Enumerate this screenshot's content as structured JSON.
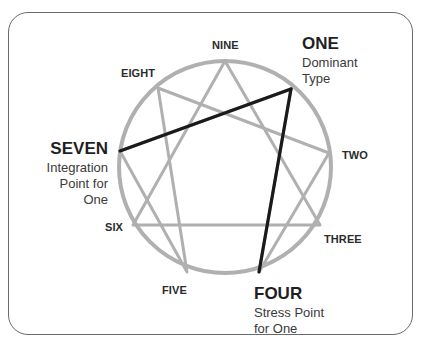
{
  "diagram": {
    "type": "enneagram",
    "colors": {
      "frame": "#6a6a6a",
      "circle": "#b0b0b0",
      "figure_lines": "#b0b0b0",
      "highlight_lines": "#1a1a1a"
    },
    "points": {
      "nine": {
        "label": "NINE"
      },
      "one": {
        "label": "ONE",
        "description_line1": "Dominant",
        "description_line2": "Type"
      },
      "two": {
        "label": "TWO"
      },
      "three": {
        "label": "THREE"
      },
      "four": {
        "label": "FOUR",
        "description_line1": "Stress Point",
        "description_line2": "for One"
      },
      "five": {
        "label": "FIVE"
      },
      "six": {
        "label": "SIX"
      },
      "seven": {
        "label": "SEVEN",
        "description_line1": "Integration",
        "description_line2": "Point for",
        "description_line3": "One"
      },
      "eight": {
        "label": "EIGHT"
      }
    },
    "connections": {
      "triangle": [
        "NINE",
        "THREE",
        "SIX"
      ],
      "hexad": [
        "ONE",
        "FOUR",
        "TWO",
        "EIGHT",
        "FIVE",
        "SEVEN",
        "ONE"
      ],
      "highlighted": [
        [
          "ONE",
          "SEVEN"
        ],
        [
          "ONE",
          "FOUR"
        ]
      ]
    }
  }
}
